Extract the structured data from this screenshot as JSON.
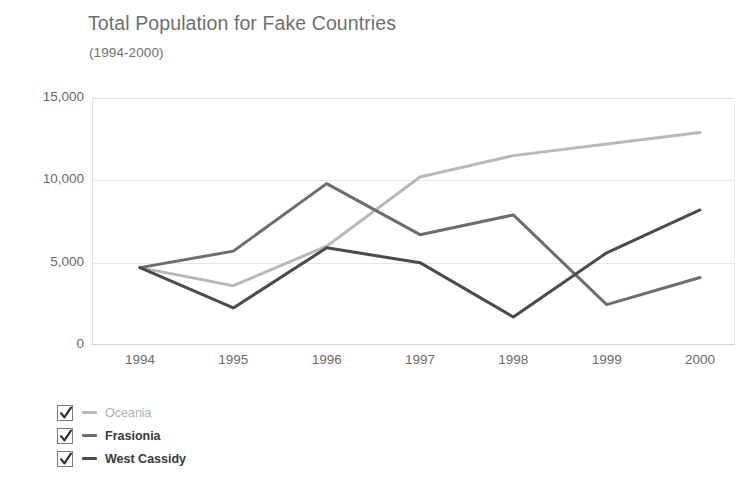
{
  "chart_data": {
    "type": "line",
    "title": "Total Population for Fake Countries",
    "subtitle": "(1994-2000)",
    "xlabel": "",
    "ylabel": "",
    "x": [
      1994,
      1995,
      1996,
      1997,
      1998,
      1999,
      2000
    ],
    "categories": [
      "1994",
      "1995",
      "1996",
      "1997",
      "1998",
      "1999",
      "2000"
    ],
    "ylim": [
      0,
      15000
    ],
    "yticks": [
      0,
      5000,
      10000,
      15000
    ],
    "ytick_labels": [
      "0",
      "5,000",
      "10,000",
      "15,000"
    ],
    "grid": true,
    "legend_position": "bottom-left",
    "series": [
      {
        "name": "Oceania",
        "color": "#b9b9b7",
        "checked": true,
        "values": [
          4700,
          3600,
          6000,
          10200,
          11500,
          12200,
          12900
        ]
      },
      {
        "name": "Frasionia",
        "color": "#6d6d6b",
        "checked": true,
        "values": [
          4700,
          5700,
          9800,
          6700,
          7900,
          2450,
          4100
        ]
      },
      {
        "name": "West Cassidy",
        "color": "#4b4b4b",
        "checked": true,
        "values": [
          4700,
          2250,
          5900,
          5000,
          1700,
          5600,
          8200
        ]
      }
    ]
  },
  "legend": {
    "checkmark_icon": "check-icon",
    "items": [
      {
        "label": "Oceania"
      },
      {
        "label": "Frasionia"
      },
      {
        "label": "West Cassidy"
      }
    ]
  }
}
